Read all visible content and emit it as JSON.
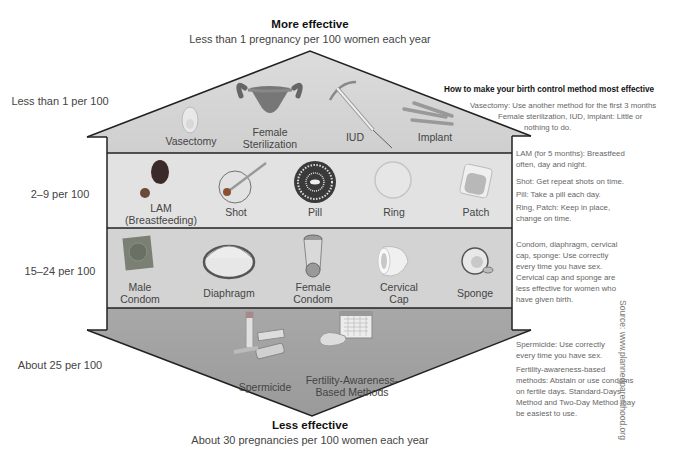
{
  "header": {
    "title": "More effective",
    "subtitle": "Less than 1 pregnancy per 100 women each year"
  },
  "footer": {
    "title": "Less effective",
    "subtitle": "About 30 pregnancies per 100 women each year"
  },
  "tiers": [
    {
      "rate": "Less than 1 per 100",
      "methods": [
        "Vasectomy",
        "Female Sterilization",
        "IUD",
        "Implant"
      ]
    },
    {
      "rate": "2–9 per 100",
      "methods": [
        "LAM (Breastfeeding)",
        "Shot",
        "Pill",
        "Ring",
        "Patch"
      ]
    },
    {
      "rate": "15–24 per 100",
      "methods": [
        "Male Condom",
        "Diaphragm",
        "Female Condom",
        "Cervical Cap",
        "Sponge"
      ]
    },
    {
      "rate": "About 25 per 100",
      "methods": [
        "Spermicide",
        "Fertility-Awareness-Based Methods"
      ]
    }
  ],
  "labels": {
    "vasectomy": "Vasectomy",
    "female_sterilization_1": "Female",
    "female_sterilization_2": "Sterilization",
    "iud": "IUD",
    "implant": "Implant",
    "lam_1": "LAM",
    "lam_2": "(Breastfeeding)",
    "shot": "Shot",
    "pill": "Pill",
    "ring": "Ring",
    "patch": "Patch",
    "male_condom_1": "Male",
    "male_condom_2": "Condom",
    "diaphragm": "Diaphragm",
    "female_condom_1": "Female",
    "female_condom_2": "Condom",
    "cervical_cap_1": "Cervical",
    "cervical_cap_2": "Cap",
    "sponge": "Sponge",
    "spermicide": "Spermicide",
    "fab_1": "Fertility-Awareness-",
    "fab_2": "Based Methods"
  },
  "guidance": {
    "title": "How to make your birth control method most effective",
    "tier1": [
      "Vasectomy: Use another method for the first 3 months",
      "Female sterilization, IUD, implant: Little or",
      "nothing to do."
    ],
    "tier2": [
      "LAM (for 5 months): Breastfeed often, day and night.",
      "Shot: Get repeat shots on time.",
      "Pill: Take a pill each day.",
      "Ring, Patch: Keep in place, change on time."
    ],
    "tier3": [
      "Condom, diaphragm, cervical cap, sponge: Use correctly every time you have sex. Cervical cap and sponge are less effective for women who have given birth."
    ],
    "tier4": [
      "Spermicide: Use correctly every time you have sex.",
      "Fertility-awareness-based methods: Abstain or use condoms on fertile days. Standard-Days Method and Two-Day Method may be easiest to use."
    ]
  },
  "source": "Source: www.plannedparenthood.org",
  "colors": {
    "roof": "#d6d6d6",
    "tier2": "#e0e0e0",
    "tier3": "#d4d4d4",
    "tier4": "#a9a9a9",
    "outline": "#222222"
  }
}
